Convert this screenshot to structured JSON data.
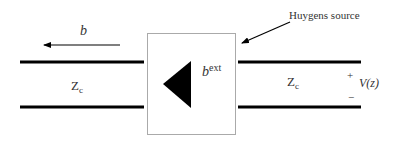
{
  "diagram": {
    "labels": {
      "wave_b": "b",
      "z_left": "Z",
      "z_left_sub": "c",
      "z_right": "Z",
      "z_right_sub": "c",
      "source_b": "b",
      "source_b_sup": "ext",
      "huygens": "Huygens source",
      "plus": "+",
      "minus": "−",
      "voltage": "V(z)"
    },
    "colors": {
      "line": "#000000",
      "box_border": "#aaaaaa",
      "text": "#333333"
    }
  }
}
